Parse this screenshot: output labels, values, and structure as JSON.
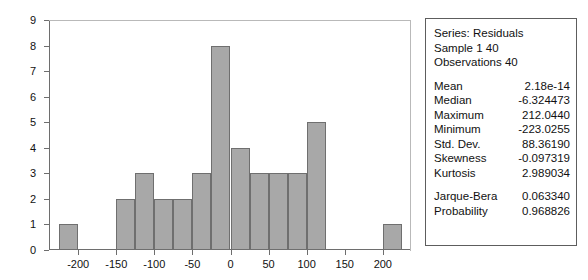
{
  "chart_data": {
    "type": "bar",
    "title": "",
    "xlabel": "",
    "ylabel": "",
    "grid": false,
    "legend_position": "none",
    "bin_width": 25,
    "xlim": [
      -237,
      237
    ],
    "ylim": [
      0,
      9
    ],
    "xticks": [
      -200,
      -150,
      -100,
      -50,
      0,
      50,
      100,
      150,
      200
    ],
    "yticks": [
      0,
      1,
      2,
      3,
      4,
      5,
      6,
      7,
      8,
      9
    ],
    "bin_edges": [
      -225,
      -200,
      -150,
      -125,
      -100,
      -75,
      -50,
      -25,
      0,
      25,
      50,
      75,
      100,
      125,
      200,
      225
    ],
    "bins": [
      {
        "left": -225,
        "right": -200,
        "count": 1
      },
      {
        "left": -150,
        "right": -125,
        "count": 2
      },
      {
        "left": -125,
        "right": -100,
        "count": 3
      },
      {
        "left": -100,
        "right": -75,
        "count": 2
      },
      {
        "left": -75,
        "right": -50,
        "count": 2
      },
      {
        "left": -50,
        "right": -25,
        "count": 3
      },
      {
        "left": -25,
        "right": 0,
        "count": 8
      },
      {
        "left": 0,
        "right": 25,
        "count": 4
      },
      {
        "left": 25,
        "right": 50,
        "count": 3
      },
      {
        "left": 50,
        "right": 75,
        "count": 3
      },
      {
        "left": 75,
        "right": 100,
        "count": 3
      },
      {
        "left": 100,
        "right": 125,
        "count": 5
      },
      {
        "left": 200,
        "right": 225,
        "count": 1
      }
    ],
    "bar_color": "#a8a8a8",
    "bar_border_color": "#6f6f6f"
  },
  "stats": {
    "header": [
      "Series: Residuals",
      "Sample 1 40",
      "Observations 40"
    ],
    "rows": [
      {
        "label": "Mean",
        "value": "2.18e-14"
      },
      {
        "label": "Median",
        "value": "-6.324473"
      },
      {
        "label": "Maximum",
        "value": "212.0440"
      },
      {
        "label": "Minimum",
        "value": "-223.0255"
      },
      {
        "label": "Std. Dev.",
        "value": "88.36190"
      },
      {
        "label": "Skewness",
        "value": "-0.097319"
      },
      {
        "label": "Kurtosis",
        "value": "2.989034"
      }
    ],
    "tests": [
      {
        "label": "Jarque-Bera",
        "value": "0.063340"
      },
      {
        "label": "Probability",
        "value": "0.968826"
      }
    ]
  }
}
